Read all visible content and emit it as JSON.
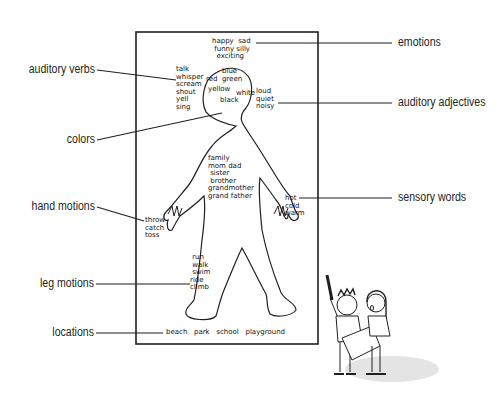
{
  "diagram": {
    "type": "annotated body outline drawing",
    "left_labels": [
      {
        "id": "auditory-verbs",
        "text": "auditory verbs"
      },
      {
        "id": "colors",
        "text": "colors"
      },
      {
        "id": "hand-motions",
        "text": "hand motions"
      },
      {
        "id": "leg-motions",
        "text": "leg motions"
      },
      {
        "id": "locations",
        "text": "locations"
      }
    ],
    "right_labels": [
      {
        "id": "emotions",
        "text": "emotions"
      },
      {
        "id": "auditory-adjectives",
        "text": "auditory adjectives"
      },
      {
        "id": "sensory-words",
        "text": "sensory words"
      }
    ],
    "handwritten": {
      "emotions": "happy  sad\n funny silly\n  exciting",
      "auditory_verbs": "talk\nwhisper\nscream\nshout\nyell\nsing",
      "colors": "red  blue\n     green\nyellow  white\n   black",
      "colors_a": "blue",
      "colors_b": "red  green",
      "colors_c": "yellow",
      "colors_d": "white",
      "colors_e": "black",
      "auditory_adjectives": "loud\nquiet\nnoisy",
      "family": "family\nmom dad\n sister\n brother\ngrandmother\ngrand father",
      "hand_motions": "throw\ncatch\ntoss",
      "sensory": "hot\ncold\nwarm",
      "leg_motions": " run\n walk\n swim\nride\nclimb",
      "locations": "beach   park   school   playground"
    },
    "colors": {
      "ink": "#231f20",
      "shadow": "#e4e4e4",
      "paper": "#ffffff"
    }
  }
}
